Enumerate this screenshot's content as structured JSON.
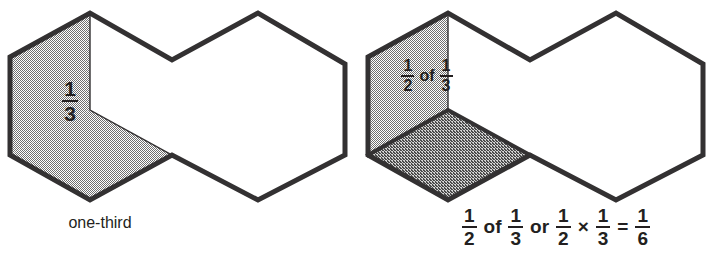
{
  "page": {
    "background_color": "#ffffff",
    "ink_color": "#333132",
    "width": 714,
    "height": 261
  },
  "figures": [
    {
      "id": "left",
      "name": "one-third-figure",
      "caption": "one-third",
      "caption_kind": "text",
      "shaded_faces": [
        {
          "name": "vertical-face",
          "fill": "light-dither",
          "fill_color": "#c9c9c9"
        },
        {
          "name": "floor-face",
          "fill": "light-dither",
          "fill_color": "#c9c9c9"
        }
      ],
      "inner_label": {
        "name": "one-third-label",
        "kind": "fraction",
        "numerator": "1",
        "denominator": "3"
      }
    },
    {
      "id": "right",
      "name": "half-of-one-third-figure",
      "caption_kind": "expression",
      "caption_parts": [
        {
          "type": "fraction",
          "numerator": "1",
          "denominator": "2"
        },
        {
          "type": "word",
          "text": "of"
        },
        {
          "type": "fraction",
          "numerator": "1",
          "denominator": "3"
        },
        {
          "type": "word",
          "text": "or"
        },
        {
          "type": "fraction",
          "numerator": "1",
          "denominator": "2"
        },
        {
          "type": "op",
          "text": "×"
        },
        {
          "type": "fraction",
          "numerator": "1",
          "denominator": "3"
        },
        {
          "type": "op",
          "text": "="
        },
        {
          "type": "fraction",
          "numerator": "1",
          "denominator": "6"
        }
      ],
      "caption_plain": "1/2 of 1/3 or 1/2 × 1/3 = 1/6",
      "shaded_faces": [
        {
          "name": "vertical-face",
          "fill": "light-dither",
          "fill_color": "#c9c9c9"
        },
        {
          "name": "floor-face",
          "fill": "dark-dither",
          "fill_color": "#8e8e8e"
        }
      ],
      "inner_label": {
        "name": "half-of-one-third-label",
        "kind": "expression",
        "parts": [
          {
            "type": "fraction",
            "numerator": "1",
            "denominator": "2"
          },
          {
            "type": "word",
            "text": "of"
          },
          {
            "type": "fraction",
            "numerator": "1",
            "denominator": "3"
          }
        ],
        "plain": "1/2 of 1/3"
      }
    }
  ],
  "geometry": {
    "note": "hexagonal prism net drawn as two joined hexagons",
    "left_origin_x": 10,
    "right_origin_x": 368,
    "outline_points": "10,57 90,13 172,60 258,13 345,64 345,155 258,200 172,155 90,200 10,155",
    "inner_vertical": "90,13 90,110",
    "inner_diagonal": "90,110 172,155"
  }
}
